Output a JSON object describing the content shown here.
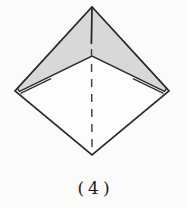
{
  "figure": {
    "kind": "origami-step-diagram",
    "step_number": "4",
    "caption": "(4)"
  },
  "diagram": {
    "paper_shape": "square rotated 45 degrees (diamond)",
    "shaded_region": "inverted-V chevron of folded flaps along the two upper edges",
    "center_slit": "vertical slit between the two folded flaps from top apex to chevron vertex",
    "fold_line": "vertical dashed valley-fold line from chevron vertex to bottom corner",
    "layer_edges": "short doubled layer-edge lines near left and right corners"
  },
  "colors": {
    "background": "#fbfbf9",
    "paper_white": "#fdfdfc",
    "paper_shaded": "#d8d8d6",
    "outline": "#2b2b2d",
    "fold_dash": "#3f3f41",
    "caption_text": "#1c1c1c"
  }
}
